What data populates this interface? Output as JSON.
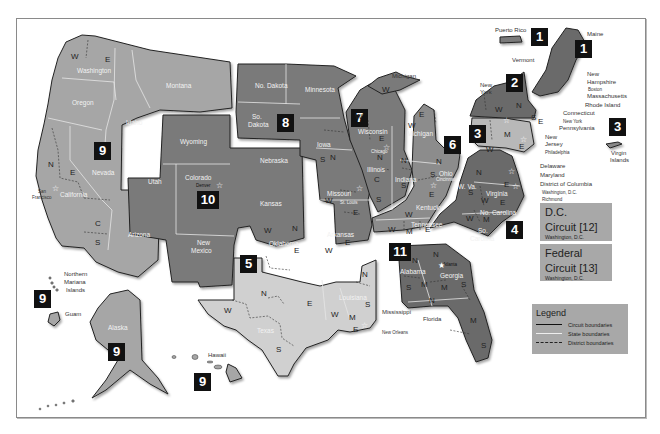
{
  "map": {
    "title": "U.S. Federal Judicial Circuits and Districts",
    "circuits": [
      {
        "number": "1",
        "states": [
          "Maine",
          "New Hampshire",
          "Massachusetts",
          "Rhode Island",
          "Puerto Rico"
        ]
      },
      {
        "number": "2",
        "states": [
          "New York",
          "Vermont",
          "Connecticut"
        ]
      },
      {
        "number": "3",
        "states": [
          "Pennsylvania",
          "New Jersey",
          "Delaware",
          "Virgin Islands"
        ]
      },
      {
        "number": "4",
        "states": [
          "Maryland",
          "W. Va.",
          "Virginia",
          "No. Carolina",
          "So. Carolina"
        ]
      },
      {
        "number": "5",
        "states": [
          "Texas",
          "Louisiana",
          "Mississippi"
        ]
      },
      {
        "number": "6",
        "states": [
          "Michigan",
          "Ohio",
          "Kentucky",
          "Tennessee"
        ]
      },
      {
        "number": "7",
        "states": [
          "Wisconsin",
          "Illinois",
          "Indiana"
        ]
      },
      {
        "number": "8",
        "states": [
          "No. Dakota",
          "So. Dakota",
          "Minnesota",
          "Nebraska",
          "Iowa",
          "Missouri",
          "Arkansas"
        ]
      },
      {
        "number": "9",
        "states": [
          "Washington",
          "Oregon",
          "Montana",
          "Idaho",
          "Nevada",
          "California",
          "Arizona",
          "Alaska",
          "Hawaii",
          "Guam",
          "Northern Mariana Islands"
        ]
      },
      {
        "number": "10",
        "states": [
          "Wyoming",
          "Utah",
          "Colorado",
          "Kansas",
          "Oklahoma",
          "New Mexico"
        ]
      },
      {
        "number": "11",
        "states": [
          "Alabama",
          "Georgia",
          "Florida"
        ]
      }
    ],
    "badges": {
      "c1_pr": "1",
      "c1": "1",
      "c2": "2",
      "c3": "3",
      "c3_vi": "3",
      "c4": "4",
      "c5": "5",
      "c6": "6",
      "c7": "7",
      "c8": "8",
      "c9": "9",
      "c9_nmi": "9",
      "c9_ak": "9",
      "c9_hi": "9",
      "c10": "10",
      "c11": "11"
    },
    "state_labels": {
      "washington": "Washington",
      "oregon": "Oregon",
      "idaho": "Idaho",
      "montana": "Montana",
      "nevada": "Nevada",
      "california": "California",
      "arizona": "Arizona",
      "utah": "Utah",
      "wyoming": "Wyoming",
      "colorado": "Colorado",
      "new_mexico_1": "New",
      "new_mexico_2": "Mexico",
      "kansas": "Kansas",
      "oklahoma": "Oklahoma",
      "no_dakota": "No. Dakota",
      "so_dakota_1": "So.",
      "so_dakota_2": "Dakota",
      "nebraska": "Nebraska",
      "minnesota": "Minnesota",
      "iowa": "Iowa",
      "missouri": "Missouri",
      "arkansas": "Arkansas",
      "texas": "Texas",
      "louisiana": "Louisiana",
      "wisconsin": "Wisconsin",
      "illinois": "Illinois",
      "indiana": "Indiana",
      "michigan": "Michigan",
      "ohio": "Ohio",
      "kentucky": "Kentucky",
      "tennessee": "Tennessee",
      "w_va": "W. Va.",
      "virginia": "Virginia",
      "no_carolina": "No. Carolina",
      "so_carolina_1": "So.",
      "so_carolina_2": "Carolina",
      "alabama": "Alabama",
      "georgia": "Georgia",
      "alaska": "Alaska"
    },
    "callout_labels": {
      "puerto_rico": "Puerto Rico",
      "maine": "Maine",
      "vermont": "Vermont",
      "new_york_1": "New",
      "new_york_2": "York",
      "new_hampshire_1": "New",
      "new_hampshire_2": "Hampshire",
      "boston": "Boston",
      "massachusetts": "Massachusetts",
      "rhode_island": "Rhode Island",
      "connecticut": "Connecticut",
      "new_york_city": "New York",
      "pennsylvania": "Pennsylvania",
      "new_jersey_1": "New",
      "new_jersey_2": "Jersey",
      "philadelphia": "Philadelphia",
      "delaware": "Delaware",
      "maryland": "Maryland",
      "district_of_columbia": "District of Columbia",
      "washington_dc": "Washington, D.C.",
      "richmond": "Richmond",
      "virgin_islands_1": "Virgin",
      "virgin_islands_2": "Islands",
      "michigan_up": "Michigan",
      "chicago": "Chicago",
      "st_louis": "St. Louis",
      "cincinnati": "Cincinnati",
      "denver": "Denver",
      "san_francisco_1": "San",
      "san_francisco_2": "Francisco",
      "mississippi": "Mississippi",
      "new_orleans": "New Orleans",
      "florida": "Florida",
      "atlanta": "Atlanta",
      "northern_mariana_1": "Northern",
      "northern_mariana_2": "Mariana",
      "northern_mariana_3": "Islands",
      "guam": "Guam",
      "hawaii": "Hawaii"
    },
    "district_letters": {
      "wa_w": "W",
      "wa_e": "E",
      "ca_n": "N",
      "ca_e": "E",
      "ca_c": "C",
      "ca_s": "S",
      "mi_up_w": "W",
      "wi_w": "W",
      "wi_e": "E",
      "mi_w": "W",
      "mi_e": "E",
      "ia_n": "N",
      "ia_s": "S",
      "il_n": "N",
      "il_c": "C",
      "il_s": "S",
      "in_n": "N",
      "in_s": "S",
      "oh_n": "N",
      "oh_s": "S",
      "mo_w": "W",
      "mo_e": "E",
      "ar_w": "W",
      "ar_e": "E",
      "ok_w": "W",
      "ok_n": "N",
      "ok_e": "E",
      "tx_n": "N",
      "tx_w": "W",
      "tx_e": "E",
      "tx_s": "S",
      "la_w": "W",
      "la_m": "M",
      "la_e": "E",
      "ms_n": "N",
      "ms_s": "S",
      "ky_e": "E",
      "ky_w": "W",
      "tn_w": "W",
      "tn_m": "M",
      "tn_e": "E",
      "wv_n": "N",
      "wv_s": "S",
      "va_w": "W",
      "va_e": "E",
      "nc_w": "W",
      "nc_m": "M",
      "nc_e": "E",
      "al_n": "N",
      "al_m": "M",
      "al_s": "S",
      "ga_n": "N",
      "ga_m": "M",
      "ga_s": "S",
      "fl_n": "N",
      "fl_m": "M",
      "fl_s": "S",
      "ny_w": "W",
      "ny_n": "N",
      "ny_s": "S",
      "ny_e": "E",
      "pa_w": "W",
      "pa_m": "M",
      "pa_e": "E"
    },
    "dc_circuit": {
      "line1": "D.C.",
      "line2": "Circuit [12]",
      "sub": "Washington, D.C."
    },
    "federal_circuit": {
      "line1": "Federal",
      "line2": "Circuit [13]",
      "sub": "Washington, D.C."
    },
    "legend": {
      "title": "Legend",
      "items": [
        {
          "label": "Circuit boundaries",
          "style": "solid-dark"
        },
        {
          "label": "State boundaries",
          "style": "solid-light"
        },
        {
          "label": "District boundaries",
          "style": "dashed"
        }
      ]
    },
    "colors": {
      "circuit_dark": "#6b6b6b",
      "circuit_mid": "#8a8a8a",
      "circuit_light": "#b4b4b4",
      "circuit_pale": "#cfcfcf",
      "badge": "#111111",
      "box": "#a8a8a8"
    }
  }
}
